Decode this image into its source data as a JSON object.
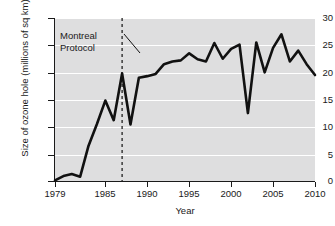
{
  "chart_data": {
    "type": "line",
    "title": "",
    "xlabel": "Year",
    "ylabel": "Size of ozone hole (millions of sq km)",
    "xlim": [
      1979,
      2010
    ],
    "ylim": [
      0,
      30
    ],
    "grid": true,
    "legend": "none",
    "y_ticks": [
      30,
      25,
      20,
      15,
      10,
      5,
      0
    ],
    "x_ticks": [
      1979,
      1985,
      1990,
      1995,
      2000,
      2005,
      2010
    ],
    "x": [
      1979,
      1980,
      1981,
      1982,
      1983,
      1984,
      1985,
      1986,
      1987,
      1988,
      1989,
      1990,
      1991,
      1992,
      1993,
      1994,
      1995,
      1996,
      1997,
      1998,
      1999,
      2000,
      2001,
      2002,
      2003,
      2004,
      2005,
      2006,
      2007,
      2008,
      2009,
      2010
    ],
    "values": [
      0.1,
      0.9,
      1.3,
      0.8,
      6.5,
      10.5,
      14.8,
      11.2,
      19.8,
      10.4,
      19.0,
      19.3,
      19.7,
      21.5,
      22.0,
      22.2,
      23.5,
      22.4,
      22.0,
      25.4,
      22.5,
      24.3,
      25.1,
      12.5,
      25.5,
      20.0,
      24.5,
      27.0,
      22.0,
      24.0,
      21.5,
      19.5
    ],
    "series_color": "#111111",
    "background_color": "#dededf",
    "gridline_color": "#ffffff",
    "annotations": [
      {
        "name": "montreal-protocol",
        "line1": "Montreal",
        "line2": "Protocol",
        "marker_year": 1987,
        "marker_style": "dashed-vertical-line"
      }
    ]
  }
}
